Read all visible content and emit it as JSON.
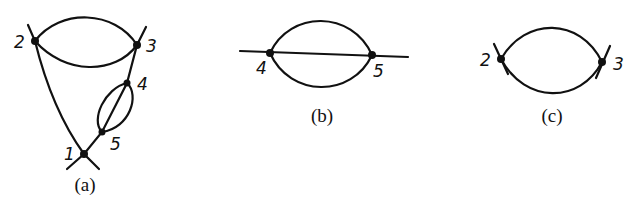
{
  "diagrams": [
    {
      "id": "a",
      "caption": "(a)",
      "nodes": [
        {
          "label": "1",
          "x": 84,
          "y": 154
        },
        {
          "label": "2",
          "x": 35,
          "y": 41
        },
        {
          "label": "3",
          "x": 137,
          "y": 45
        },
        {
          "label": "4",
          "x": 127,
          "y": 83
        },
        {
          "label": "5",
          "x": 102,
          "y": 132
        }
      ]
    },
    {
      "id": "b",
      "caption": "(b)",
      "nodes": [
        {
          "label": "4",
          "x": 270,
          "y": 53
        },
        {
          "label": "5",
          "x": 372,
          "y": 55
        }
      ]
    },
    {
      "id": "c",
      "caption": "(c)",
      "nodes": [
        {
          "label": "2",
          "x": 501,
          "y": 59
        },
        {
          "label": "3",
          "x": 602,
          "y": 62
        }
      ]
    }
  ],
  "colors": {
    "ink": "#111111",
    "background": "#ffffff"
  }
}
